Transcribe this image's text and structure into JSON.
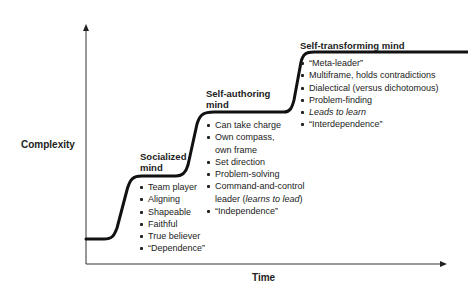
{
  "axes": {
    "y_label": "Complexity",
    "x_label": "Time"
  },
  "stages": [
    {
      "title_line1": "Socialized",
      "title_line2": "mind",
      "traits": [
        "Team player",
        "Aligning",
        "Shapeable",
        "Faithful",
        "True believer",
        "“Dependence”"
      ]
    },
    {
      "title_line1": "Self-authoring",
      "title_line2": "mind",
      "traits": [
        "Can take charge",
        "Own compass,",
        "own frame",
        "Set direction",
        "Problem-solving",
        "Command-and-control",
        "leader (",
        "learns to lead",
        ")",
        "“Independence”"
      ]
    },
    {
      "title_line1": "Self-transforming mind",
      "traits": [
        "“Meta-leader”",
        "Multiframe, holds contradictions",
        "Dialectical (versus dichotomous)",
        "Problem-finding",
        "Leads to learn",
        "“Interdependence”"
      ]
    }
  ],
  "colors": {
    "curve": "#111111",
    "axis": "#333333",
    "text": "#222222"
  }
}
